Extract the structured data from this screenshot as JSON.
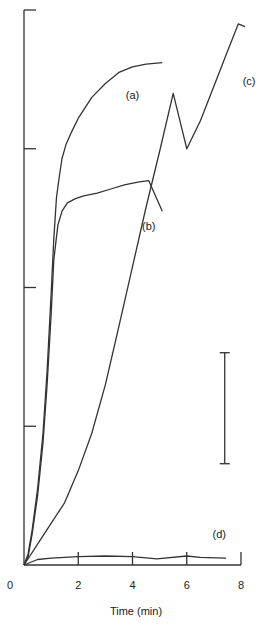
{
  "chart_data": {
    "type": "line",
    "title": "",
    "xlabel": "Time (min)",
    "ylabel": "",
    "xlim": [
      0,
      8
    ],
    "ylim": [
      0,
      4
    ],
    "x_ticks": [
      0,
      2,
      4,
      6,
      8
    ],
    "x_tick_labels": [
      "0",
      "2",
      "4",
      "6",
      "8"
    ],
    "y_ticks": [
      0,
      1,
      2,
      3,
      4
    ],
    "y_tick_labels": [],
    "grid": false,
    "legend": "inline curve labels",
    "scale_bar": {
      "x": 7.4,
      "y_from": 0.73,
      "y_to": 1.53,
      "label": ""
    },
    "series": [
      {
        "name": "(a)",
        "label_pos": [
          4.0,
          3.39
        ],
        "x": [
          0,
          0.15,
          0.3,
          0.5,
          0.7,
          0.85,
          1.0,
          1.1,
          1.2,
          1.3,
          1.4,
          1.55,
          1.75,
          2.0,
          2.5,
          3.0,
          3.5,
          4.0,
          4.5,
          5.1
        ],
        "y": [
          0,
          0.08,
          0.25,
          0.55,
          0.95,
          1.4,
          1.95,
          2.35,
          2.65,
          2.8,
          2.93,
          3.03,
          3.12,
          3.22,
          3.37,
          3.47,
          3.55,
          3.59,
          3.61,
          3.62
        ]
      },
      {
        "name": "(b)",
        "label_pos": [
          4.6,
          2.44
        ],
        "x": [
          0,
          0.15,
          0.3,
          0.5,
          0.7,
          0.85,
          1.0,
          1.1,
          1.25,
          1.4,
          1.6,
          1.9,
          2.2,
          2.7,
          3.2,
          3.7,
          4.2,
          4.6,
          5.1
        ],
        "y": [
          0,
          0.06,
          0.22,
          0.5,
          0.88,
          1.3,
          1.8,
          2.2,
          2.45,
          2.55,
          2.61,
          2.64,
          2.66,
          2.68,
          2.71,
          2.74,
          2.76,
          2.77,
          2.55
        ]
      },
      {
        "name": "(c)",
        "label_pos": [
          8.3,
          3.49
        ],
        "x": [
          0,
          0.5,
          1.0,
          1.5,
          2.0,
          2.5,
          3.0,
          3.5,
          4.0,
          4.5,
          5.0,
          5.5,
          6.0,
          6.5,
          7.0,
          7.5,
          7.9,
          8.15
        ],
        "y": [
          0,
          0.15,
          0.3,
          0.45,
          0.68,
          0.95,
          1.3,
          1.72,
          2.15,
          2.58,
          2.98,
          3.4,
          3.0,
          3.2,
          3.45,
          3.7,
          3.9,
          3.88
        ]
      },
      {
        "name": "(d)",
        "label_pos": [
          7.2,
          0.22
        ],
        "x": [
          0,
          0.5,
          1.0,
          2.0,
          3.0,
          4.0,
          4.9,
          6.0,
          6.5,
          7.45
        ],
        "y": [
          0,
          0.04,
          0.05,
          0.06,
          0.065,
          0.06,
          0.045,
          0.065,
          0.055,
          0.05
        ]
      }
    ]
  }
}
